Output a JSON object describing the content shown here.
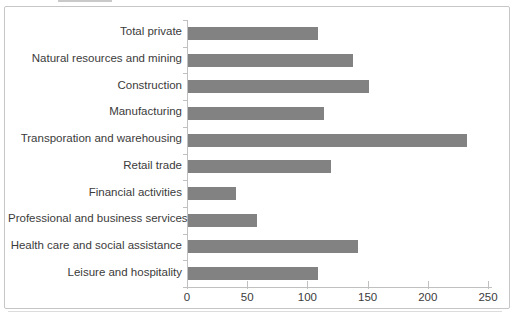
{
  "chart_data": {
    "type": "bar",
    "orientation": "horizontal",
    "title": "",
    "xlabel": "",
    "ylabel": "",
    "categories": [
      "Total private",
      "Natural resources and mining",
      "Construction",
      "Manufacturing",
      "Transporation and warehousing",
      "Retail trade",
      "Financial activities",
      "Professional and business services",
      "Health care and social assistance",
      "Leisure and hospitality"
    ],
    "values": [
      108,
      137,
      150,
      113,
      232,
      119,
      40,
      57,
      141,
      108
    ],
    "xlim": [
      0,
      250
    ],
    "x_ticks": [
      0,
      50,
      100,
      150,
      200,
      250
    ],
    "grid": false,
    "legend_position": "none",
    "colors": {
      "bar": "#828282",
      "axis": "#c0c0c0",
      "text": "#3b3b3b",
      "frame_border": "#c6c6c6",
      "background": "#ffffff"
    }
  }
}
